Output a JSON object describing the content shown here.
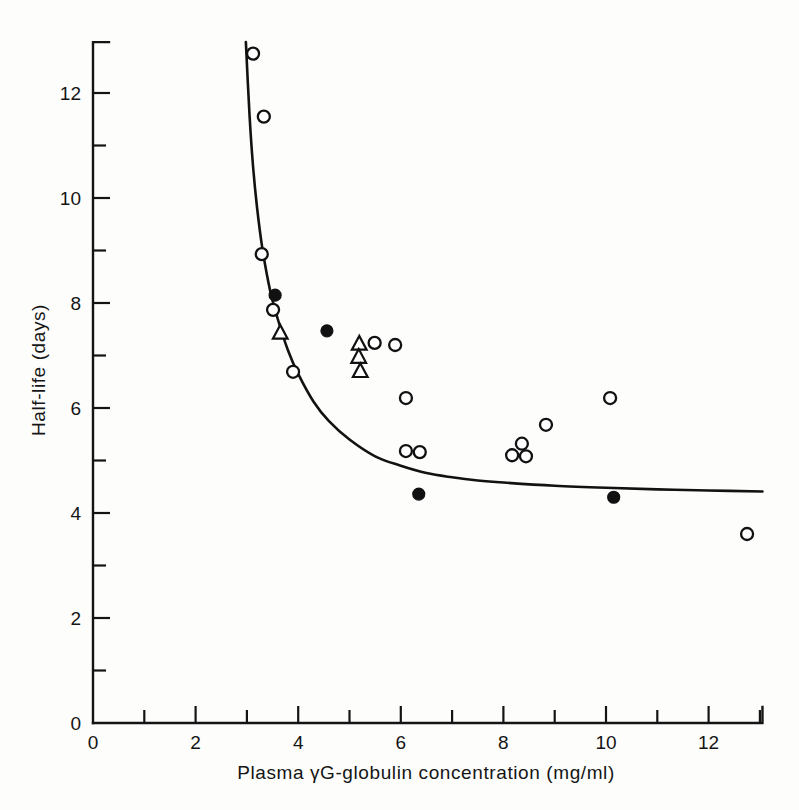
{
  "figure": {
    "background_color": "#fdfdfc",
    "ink_color": "#111111"
  },
  "axes": {
    "x_title": "Plasma γG-globulin concentration (mg/ml)",
    "y_title": "Half-life (days)",
    "x_tick_labels": [
      "0",
      "2",
      "4",
      "6",
      "8",
      "10",
      "12"
    ],
    "y_tick_labels": [
      "0",
      "2",
      "4",
      "6",
      "8",
      "10",
      "12"
    ]
  },
  "chart_data": {
    "type": "scatter",
    "title": "",
    "xlabel": "Plasma γG-globulin concentration (mg/ml)",
    "ylabel": "Half-life (days)",
    "xlim": [
      0,
      13.05
    ],
    "ylim": [
      0,
      12.97
    ],
    "grid": false,
    "legend": "none",
    "x_ticks_major": [
      0,
      2,
      4,
      6,
      8,
      10,
      12
    ],
    "x_ticks_minor": [
      1,
      3,
      5,
      7,
      9,
      11,
      13
    ],
    "y_ticks_major": [
      0,
      2,
      4,
      6,
      8,
      10,
      12
    ],
    "y_ticks_minor": [
      1,
      3,
      5,
      7,
      9,
      11
    ],
    "series": [
      {
        "name": "open-circle",
        "marker": "open circle",
        "points": [
          [
            3.12,
            12.75
          ],
          [
            3.33,
            11.55
          ],
          [
            3.29,
            8.93
          ],
          [
            3.51,
            7.87
          ],
          [
            3.9,
            6.69
          ],
          [
            5.89,
            7.2
          ],
          [
            5.49,
            7.24
          ],
          [
            6.1,
            6.19
          ],
          [
            6.1,
            5.18
          ],
          [
            6.37,
            5.16
          ],
          [
            8.17,
            5.1
          ],
          [
            8.44,
            5.08
          ],
          [
            8.36,
            5.32
          ],
          [
            8.83,
            5.68
          ],
          [
            10.08,
            6.19
          ],
          [
            12.75,
            3.6
          ]
        ]
      },
      {
        "name": "filled-circle",
        "marker": "filled circle",
        "points": [
          [
            3.55,
            8.15
          ],
          [
            4.56,
            7.47
          ],
          [
            6.35,
            4.36
          ],
          [
            10.15,
            4.3
          ]
        ]
      },
      {
        "name": "triangle",
        "marker": "open triangle",
        "points": [
          [
            3.65,
            7.43
          ],
          [
            5.19,
            7.22
          ],
          [
            5.18,
            6.97
          ],
          [
            5.21,
            6.7
          ]
        ]
      }
    ],
    "fit_curve": {
      "name": "fitted hyperbola",
      "style": "solid line",
      "points": [
        [
          2.98,
          12.97
        ],
        [
          3.05,
          11.6
        ],
        [
          3.12,
          10.6
        ],
        [
          3.2,
          9.8
        ],
        [
          3.3,
          9.05
        ],
        [
          3.45,
          8.25
        ],
        [
          3.6,
          7.7
        ],
        [
          3.8,
          7.1
        ],
        [
          4.0,
          6.65
        ],
        [
          4.3,
          6.12
        ],
        [
          4.6,
          5.75
        ],
        [
          5.0,
          5.4
        ],
        [
          5.5,
          5.08
        ],
        [
          6.0,
          4.9
        ],
        [
          6.5,
          4.76
        ],
        [
          7.0,
          4.68
        ],
        [
          7.5,
          4.62
        ],
        [
          8.0,
          4.58
        ],
        [
          9.0,
          4.52
        ],
        [
          10.0,
          4.48
        ],
        [
          11.0,
          4.45
        ],
        [
          12.0,
          4.43
        ],
        [
          13.05,
          4.41
        ]
      ]
    }
  }
}
